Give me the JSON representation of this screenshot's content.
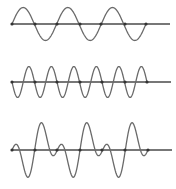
{
  "diagram": {
    "title": "",
    "colors": {
      "axis": "#4a4a4a",
      "wave": "#6a6a6a",
      "dot": "#333333",
      "background": "#ffffff"
    },
    "waves": [
      {
        "id": "wave-1",
        "label": "",
        "axis_y": 24,
        "axis_x_start": 12,
        "axis_x_end": 170,
        "wave_x_start": 12,
        "wave_x_end": 146,
        "components": [
          {
            "amplitude": 16.5,
            "cycles": 3,
            "sign": 1
          }
        ],
        "zero_crossing_dots": [
          12,
          35,
          57,
          80,
          101,
          125,
          146
        ]
      },
      {
        "id": "wave-2",
        "label": "",
        "axis_y": 82,
        "axis_x_start": 12,
        "axis_x_end": 171,
        "wave_x_start": 12,
        "wave_x_end": 147,
        "components": [
          {
            "amplitude": 15.5,
            "cycles": 6,
            "sign": -1
          }
        ],
        "zero_crossing_dots": [
          12,
          35,
          57,
          80,
          102,
          125,
          147
        ]
      },
      {
        "id": "wave-3",
        "label": "",
        "axis_y": 150,
        "axis_x_start": 12,
        "axis_x_end": 172,
        "wave_x_start": 12,
        "wave_x_end": 148,
        "components": [
          {
            "amplitude": 15.5,
            "cycles": 6,
            "sign": 1
          },
          {
            "amplitude": 15.5,
            "cycles": 3,
            "sign": -1
          }
        ],
        "zero_crossing_dots": [
          12,
          35,
          57,
          80,
          102,
          125,
          148
        ]
      }
    ]
  }
}
